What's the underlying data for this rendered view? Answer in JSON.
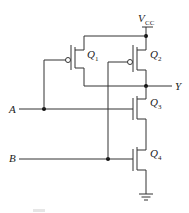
{
  "diagram": {
    "type": "CMOS NAND gate schematic",
    "supply": {
      "label": "V",
      "subscript": "CC"
    },
    "output": {
      "label": "Y"
    },
    "inputs": [
      {
        "label": "A"
      },
      {
        "label": "B"
      }
    ],
    "transistors": [
      {
        "name": "Q",
        "index": "1",
        "type": "PMOS"
      },
      {
        "name": "Q",
        "index": "2",
        "type": "PMOS"
      },
      {
        "name": "Q",
        "index": "3",
        "type": "NMOS"
      },
      {
        "name": "Q",
        "index": "4",
        "type": "NMOS"
      }
    ],
    "ground": {
      "symbol": "ground"
    }
  }
}
